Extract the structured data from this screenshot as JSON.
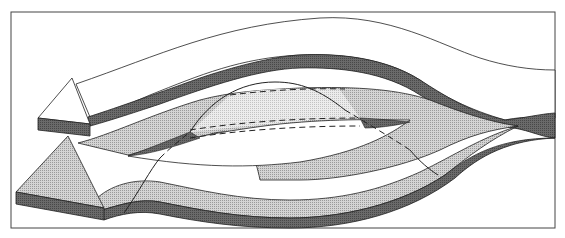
{
  "diagram": {
    "title": "",
    "colors": {
      "frame": "#333333",
      "dark_edge": "#5a5a5a",
      "stipple": "#c8c8c8",
      "stipple_light": "#e2e2e2",
      "white_band": "#ffffff",
      "line": "#222222"
    },
    "elements": [
      {
        "name": "upper-white-arrow",
        "shape": "band-with-arrowhead",
        "direction": "left"
      },
      {
        "name": "lower-stippled-arrow",
        "shape": "band-with-arrowhead",
        "direction": "left"
      },
      {
        "name": "split-eye-opening",
        "shape": "lens"
      },
      {
        "name": "sine-curve",
        "shape": "curve",
        "style": "solid+dashed"
      }
    ]
  }
}
